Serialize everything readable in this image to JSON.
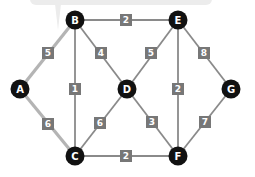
{
  "colors": {
    "background": "#ffffff",
    "bubble": "#ececec",
    "edge": "#8a8a8a",
    "highlight_edge": "#b4b4b4",
    "node": "#111111",
    "node_text": "#ffffff",
    "weight_box": "#777777",
    "weight_text": "#ffffff"
  },
  "graph": {
    "nodes": [
      {
        "id": "A",
        "label": "A",
        "x": 20,
        "y": 89
      },
      {
        "id": "B",
        "label": "B",
        "x": 75,
        "y": 20
      },
      {
        "id": "C",
        "label": "C",
        "x": 75,
        "y": 156
      },
      {
        "id": "D",
        "label": "D",
        "x": 127,
        "y": 89
      },
      {
        "id": "E",
        "label": "E",
        "x": 178,
        "y": 20
      },
      {
        "id": "F",
        "label": "F",
        "x": 178,
        "y": 156
      },
      {
        "id": "G",
        "label": "G",
        "x": 231,
        "y": 89
      }
    ],
    "edges": [
      {
        "from": "A",
        "to": "B",
        "weight": "5",
        "highlight": true,
        "lx": 48,
        "ly": 53
      },
      {
        "from": "A",
        "to": "C",
        "weight": "6",
        "highlight": true,
        "lx": 48,
        "ly": 124
      },
      {
        "from": "B",
        "to": "C",
        "weight": "1",
        "highlight": false,
        "lx": 75,
        "ly": 89
      },
      {
        "from": "B",
        "to": "D",
        "weight": "4",
        "highlight": false,
        "lx": 101,
        "ly": 53
      },
      {
        "from": "B",
        "to": "E",
        "weight": "2",
        "highlight": false,
        "lx": 126,
        "ly": 20
      },
      {
        "from": "C",
        "to": "D",
        "weight": "6",
        "highlight": false,
        "lx": 100,
        "ly": 123
      },
      {
        "from": "C",
        "to": "F",
        "weight": "2",
        "highlight": false,
        "lx": 126,
        "ly": 156
      },
      {
        "from": "D",
        "to": "E",
        "weight": "5",
        "highlight": false,
        "lx": 151,
        "ly": 53
      },
      {
        "from": "D",
        "to": "F",
        "weight": "3",
        "highlight": false,
        "lx": 152,
        "ly": 122
      },
      {
        "from": "E",
        "to": "F",
        "weight": "2",
        "highlight": false,
        "lx": 178,
        "ly": 89
      },
      {
        "from": "E",
        "to": "G",
        "weight": "8",
        "highlight": false,
        "lx": 204,
        "ly": 53
      },
      {
        "from": "F",
        "to": "G",
        "weight": "7",
        "highlight": false,
        "lx": 205,
        "ly": 122
      }
    ]
  },
  "tooltip_bubble": {
    "x": 30,
    "y": -10,
    "width": 182,
    "height": 15,
    "tail_x": 58,
    "tail_y": 30
  }
}
